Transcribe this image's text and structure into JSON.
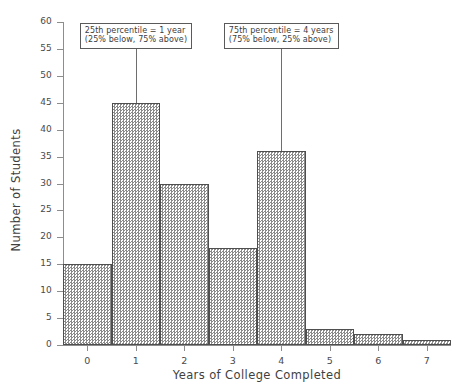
{
  "chart_data": {
    "type": "bar",
    "title": "",
    "subtitle": "",
    "xlabel": "Years of College Completed",
    "ylabel": "Number of Students",
    "categories": [
      "0",
      "1",
      "2",
      "3",
      "4",
      "5",
      "6",
      "7"
    ],
    "values": [
      15,
      45,
      30,
      18,
      36,
      3,
      2,
      1
    ],
    "series": [
      {
        "name": "Number of Students",
        "values": [
          15,
          45,
          30,
          18,
          36,
          3,
          2,
          1
        ]
      }
    ],
    "xlim": [
      -0.5,
      7.5
    ],
    "ylim": [
      0,
      60
    ],
    "ytick_values": [
      0,
      5,
      10,
      15,
      20,
      25,
      30,
      35,
      40,
      45,
      50,
      55,
      60
    ],
    "ytick_labels": [
      "0",
      "5",
      "10",
      "15",
      "20",
      "25",
      "30",
      "35",
      "40",
      "45",
      "50",
      "55",
      "60"
    ],
    "xtick_values": [
      0,
      1,
      2,
      3,
      4,
      5,
      6,
      7
    ],
    "xtick_labels": [
      "0",
      "1",
      "2",
      "3",
      "4",
      "5",
      "6",
      "7"
    ],
    "grid": false,
    "legend": false,
    "bar_fill": "crosshatch-gray",
    "bar_edge_color": "#4f4f4f",
    "annotations": [
      {
        "id": "p25",
        "line1": "25th percentile = 1 year",
        "line2": "(25% below, 75% above)",
        "x_value": 1,
        "y_top": 55,
        "y_bottom": 45
      },
      {
        "id": "p75",
        "line1": "75th percentile = 4 years",
        "line2": "(75% below, 25% above)",
        "x_value": 4,
        "y_top": 55,
        "y_bottom": 36
      }
    ]
  }
}
